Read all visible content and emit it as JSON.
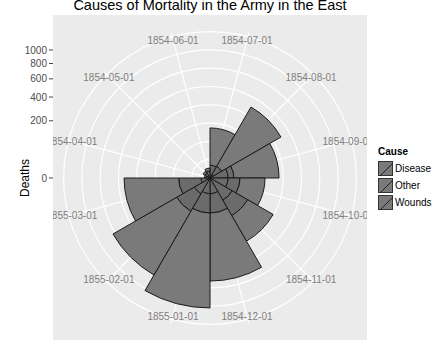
{
  "chart_data": {
    "type": "polar-bar",
    "title": "Causes of Mortality in the Army in the East",
    "xlabel": "",
    "ylabel": "Deaths",
    "y_scale": "sqrt",
    "y_ticks": [
      0,
      200,
      400,
      600,
      800,
      1000
    ],
    "legend": {
      "title": "Cause",
      "position": "right",
      "entries": [
        "Disease",
        "Other",
        "Wounds"
      ]
    },
    "categories": [
      "1854-07-01",
      "1854-08-01",
      "1854-09-01",
      "1854-10-01",
      "1854-11-01",
      "1854-12-01",
      "1855-01-01",
      "1855-02-01",
      "1855-03-01",
      "1854-04-01",
      "1854-05-01",
      "1854-06-01"
    ],
    "series": [
      {
        "name": "Wounds",
        "values": [
          0,
          1,
          20,
          20,
          40,
          15,
          15,
          20,
          5,
          0,
          0,
          0
        ]
      },
      {
        "name": "Other",
        "values": [
          10,
          10,
          15,
          35,
          75,
          60,
          60,
          70,
          55,
          1,
          2,
          3
        ]
      },
      {
        "name": "Disease",
        "values": [
          143,
          399,
          256,
          130,
          210,
          573,
          956,
          676,
          391,
          1,
          2,
          3
        ]
      }
    ],
    "totals": [
      153,
      410,
      291,
      185,
      325,
      648,
      1031,
      766,
      451,
      2,
      4,
      6
    ],
    "grid": true
  },
  "axis": {
    "ylabel": "Deaths",
    "tick_labels": [
      "0",
      "200",
      "400",
      "600",
      "800",
      "1000"
    ]
  },
  "legend": {
    "title": "Cause",
    "items": [
      "Disease",
      "Other",
      "Wounds"
    ]
  },
  "colors": {
    "panel": "#ebebeb",
    "grid": "#ffffff",
    "fill": "#7a7a7a",
    "fill_inner": "#6b6b6b",
    "stroke": "#1a1a1a",
    "label": "#7f7f7f"
  }
}
